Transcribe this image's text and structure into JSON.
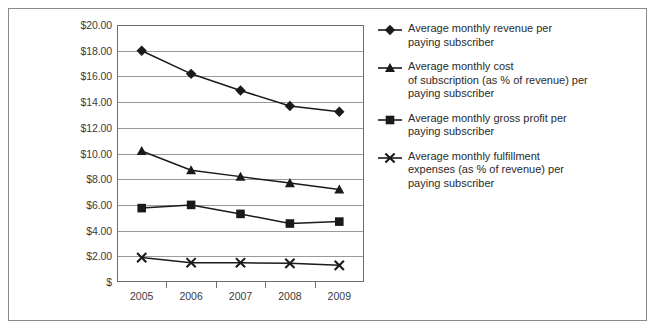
{
  "chart_data": {
    "type": "line",
    "title": "",
    "subtitle": "",
    "xlabel": "",
    "ylabel": "",
    "categories": [
      "2005",
      "2006",
      "2007",
      "2008",
      "2009"
    ],
    "ylim": [
      0,
      20
    ],
    "ytick_labels": [
      "$20.00",
      "$18.00",
      "$16.00",
      "$14.00",
      "$12.00",
      "$10.00",
      "$8.00",
      "$6.00",
      "$4.00",
      "$2.00",
      "$"
    ],
    "ytick_values": [
      20,
      18,
      16,
      14,
      12,
      10,
      8,
      6,
      4,
      2,
      0
    ],
    "grid": "horizontal",
    "legend_position": "right",
    "series": [
      {
        "name": "Average monthly revenue per paying subscriber",
        "name_lines": [
          "Average monthly revenue per",
          "paying subscriber"
        ],
        "marker": "diamond",
        "color": "#1a1a1a",
        "values": [
          18.0,
          16.2,
          14.9,
          13.7,
          13.25
        ]
      },
      {
        "name": "Average monthly cost of subscription (as % of revenue) per paying subscriber",
        "name_lines": [
          "Average monthly cost",
          "of subscription (as % of revenue) per",
          "paying subscriber"
        ],
        "marker": "triangle",
        "color": "#1a1a1a",
        "values": [
          10.2,
          8.7,
          8.2,
          7.7,
          7.2
        ]
      },
      {
        "name": "Average monthly gross profit per paying subscriber",
        "name_lines": [
          "Average monthly gross profit per",
          "paying subscriber"
        ],
        "marker": "square",
        "color": "#1a1a1a",
        "values": [
          5.75,
          6.0,
          5.3,
          4.55,
          4.7
        ]
      },
      {
        "name": "Average monthly fulfillment expenses (as % of revenue) per paying subscriber",
        "name_lines": [
          "Average monthly fulfillment",
          "expenses (as % of revenue) per",
          "paying subscriber"
        ],
        "marker": "x",
        "color": "#1a1a1a",
        "values": [
          1.9,
          1.5,
          1.5,
          1.45,
          1.3
        ]
      }
    ],
    "colors": {
      "gridline": "#9a9a9a",
      "axis": "#6e6e6e",
      "series": "#1a1a1a",
      "frame": "#8a8a8a",
      "background": "#ffffff",
      "text": "#2b2b2b"
    }
  }
}
